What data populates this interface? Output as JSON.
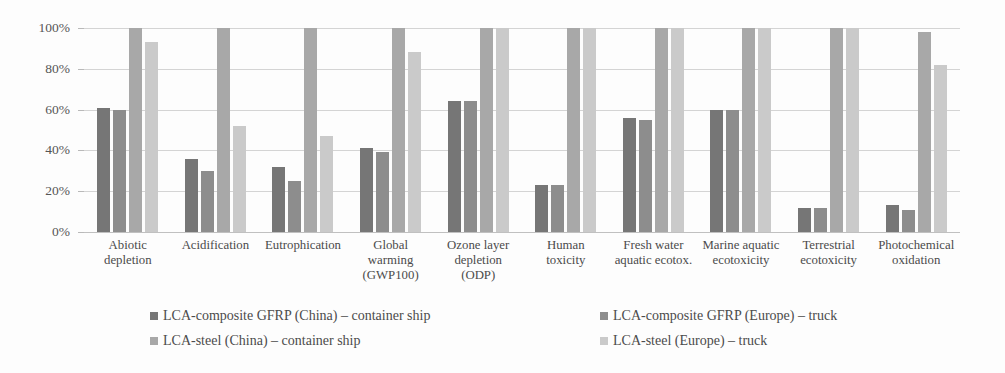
{
  "chart_data": {
    "type": "bar",
    "title": "",
    "xlabel": "",
    "ylabel": "",
    "ylim": [
      0,
      100
    ],
    "grid": true,
    "legend_position": "bottom",
    "y_ticks": [
      "0%",
      "20%",
      "40%",
      "60%",
      "80%",
      "100%"
    ],
    "y_tick_values": [
      0,
      20,
      40,
      60,
      80,
      100
    ],
    "categories": [
      "Abiotic\ndepletion",
      "Acidification",
      "Eutrophication",
      "Global\nwarming\n(GWP100)",
      "Ozone layer\ndepletion\n(ODP)",
      "Human\ntoxicity",
      "Fresh water\naquatic ecotox.",
      "Marine aquatic\necotoxicity",
      "Terrestrial\necotoxicity",
      "Photochemical\noxidation"
    ],
    "series": [
      {
        "name": "LCA-composite GFRP (China) – container ship",
        "color": "#767676",
        "values": [
          61,
          36,
          32,
          41,
          64,
          23,
          56,
          60,
          12,
          13
        ]
      },
      {
        "name": "LCA-composite GFRP (Europe) – truck",
        "color": "#8d8d8d",
        "values": [
          60,
          30,
          25,
          39,
          64,
          23,
          55,
          60,
          12,
          11
        ]
      },
      {
        "name": "LCA-steel (China) – container ship",
        "color": "#a8a8a8",
        "values": [
          100,
          100,
          100,
          100,
          100,
          100,
          100,
          100,
          100,
          98
        ]
      },
      {
        "name": "LCA-steel (Europe) – truck",
        "color": "#cacaca",
        "values": [
          93,
          52,
          47,
          88,
          100,
          100,
          100,
          100,
          100,
          82
        ]
      }
    ]
  },
  "legend": {
    "items": [
      {
        "label": "LCA-composite GFRP (China) – container ship",
        "color": "#767676"
      },
      {
        "label": "LCA-composite GFRP (Europe) – truck",
        "color": "#8d8d8d"
      },
      {
        "label": "LCA-steel (China) – container ship",
        "color": "#a8a8a8"
      },
      {
        "label": "LCA-steel (Europe) – truck",
        "color": "#cacaca"
      }
    ]
  }
}
